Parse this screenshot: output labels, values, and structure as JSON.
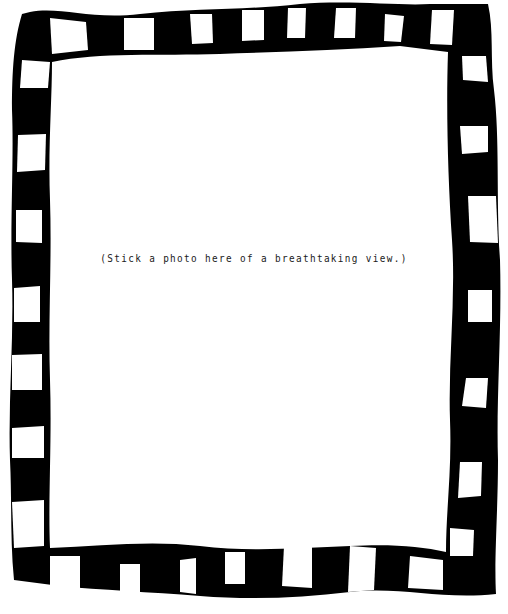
{
  "frame": {
    "style": "film-strip",
    "stroke_color": "#000000",
    "hole_color": "#ffffff"
  },
  "placeholder": {
    "caption": "(Stick a photo here of a breathtaking view.)"
  }
}
